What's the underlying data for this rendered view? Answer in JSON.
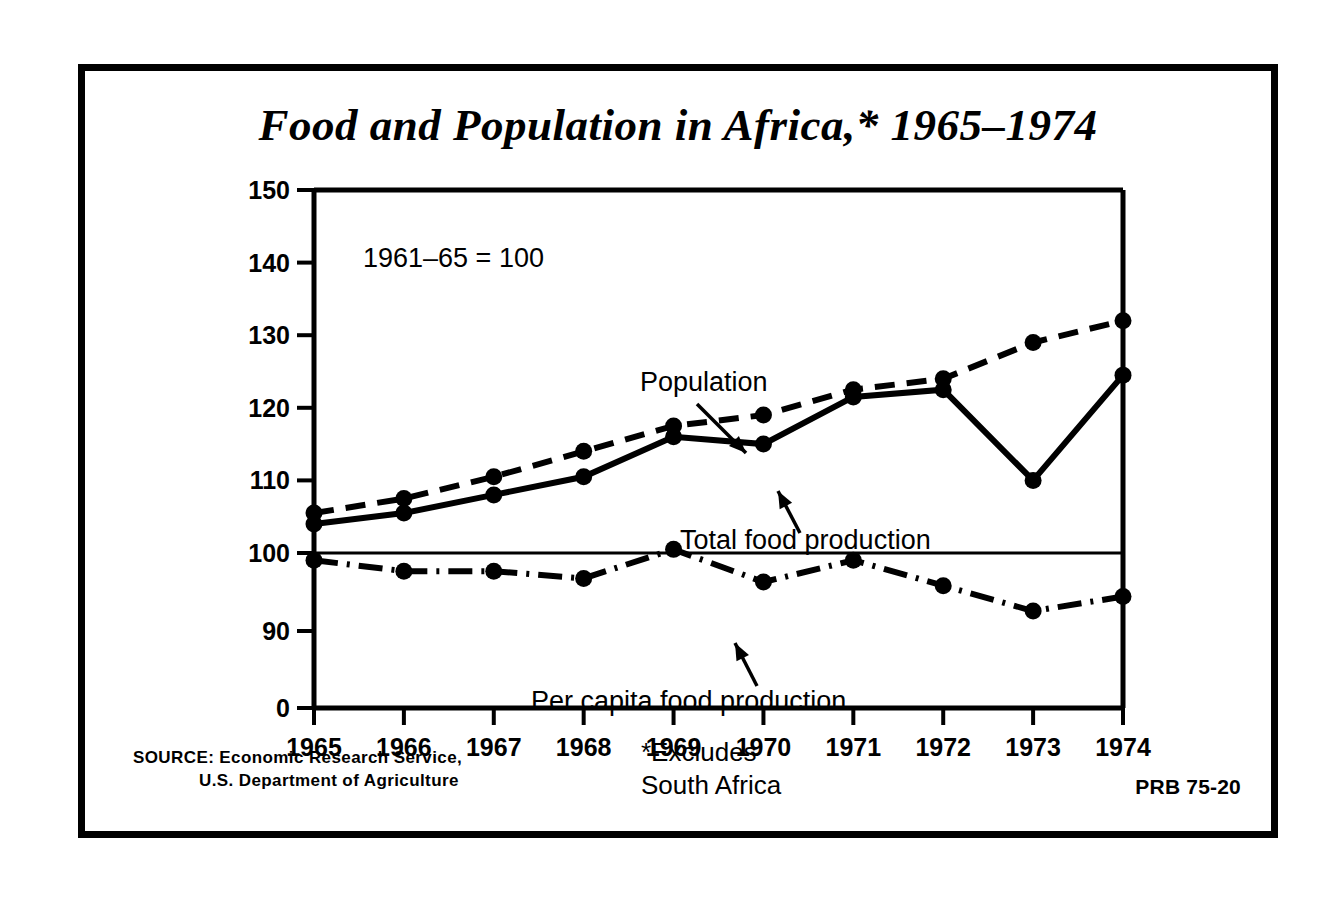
{
  "poster": {
    "title": "Food and Population in Africa,* 1965–1974",
    "index_note": "1961–65 = 100",
    "source_label": "SOURCE:",
    "source_line1": "Economic Research Service,",
    "source_line2": "U.S. Department of Agriculture",
    "footnote_line1": "*Excludes",
    "footnote_line2": "South Africa",
    "publication_code": "PRB 75-20",
    "ink_color": "#000000",
    "paper_color": "#ffffff"
  },
  "chart_data": {
    "type": "line",
    "title": "Food and Population in Africa,* 1965–1974",
    "subtitle": "1961–65 = 100",
    "xlabel": "",
    "ylabel": "",
    "x": [
      1965,
      1966,
      1967,
      1968,
      1969,
      1970,
      1971,
      1972,
      1973,
      1974
    ],
    "categories": [
      "1965",
      "1966",
      "1967",
      "1968",
      "1969",
      "1970",
      "1971",
      "1972",
      "1973",
      "1974"
    ],
    "ylim": [
      87,
      150
    ],
    "ytick_values": [
      0,
      90,
      100,
      110,
      120,
      130,
      140,
      150
    ],
    "ytick_labels": [
      "0",
      "90",
      "100",
      "110",
      "120",
      "130",
      "140",
      "150"
    ],
    "axis_break": true,
    "grid": false,
    "legend": "inline-annotations",
    "reference_line": 100,
    "series": [
      {
        "name": "Population",
        "style": "dashed",
        "values": [
          105.5,
          107.5,
          110.5,
          114,
          117.5,
          119,
          122.5,
          124,
          129,
          132
        ]
      },
      {
        "name": "Total food production",
        "style": "solid",
        "values": [
          104,
          105.5,
          108,
          110.5,
          116,
          115,
          121.5,
          122.5,
          110,
          124.5
        ]
      },
      {
        "name": "Per capita food production",
        "style": "dash-dot",
        "values": [
          99,
          97.5,
          97.5,
          96.5,
          100.5,
          96,
          99,
          95.5,
          92,
          94
        ]
      }
    ],
    "annotations": [
      {
        "text": "Population",
        "target_series": "Population",
        "target_x": 1969
      },
      {
        "text": "Total food production",
        "target_series": "Total food production",
        "target_x": 1970
      },
      {
        "text": "Per capita food production",
        "target_series": "Per capita food production",
        "target_x": 1970
      }
    ]
  }
}
